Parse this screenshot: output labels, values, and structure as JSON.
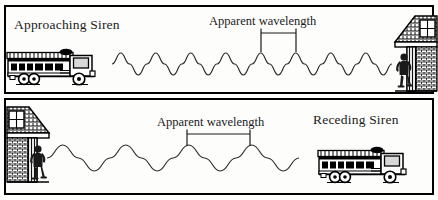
{
  "figure": {
    "title_alt": "Doppler effect: approaching and receding siren",
    "background": "#fdfdfc",
    "ink": "#000000",
    "border_width_px": 2,
    "width": 438,
    "height": 200
  },
  "panels": [
    {
      "id": "top",
      "name": "approaching-siren-panel",
      "label": "Approaching Siren",
      "annotation": "Apparent wavelength",
      "source": "fire-truck",
      "source_side": "left",
      "observer_side": "right",
      "wave": {
        "cycles": 8,
        "wavelength_px": 35,
        "amplitude_px": 11,
        "start_x": 112,
        "end_x": 392,
        "baseline_y": 64,
        "description": "short wavelength, compressed waves"
      },
      "bracket": {
        "x_start": 261,
        "x_end": 296,
        "y": 33,
        "tick_height": 9,
        "measures": "one wavelength (peak to peak)"
      }
    },
    {
      "id": "bottom",
      "name": "receding-siren-panel",
      "label": "Receding Siren",
      "annotation": "Apparent wavelength",
      "source": "fire-truck",
      "source_side": "right",
      "observer_side": "left",
      "wave": {
        "cycles": 4,
        "wavelength_px": 63,
        "amplitude_px": 13,
        "start_x": 47,
        "end_x": 299,
        "baseline_y": 158,
        "description": "long wavelength, stretched waves"
      },
      "bracket": {
        "x_start": 187,
        "x_end": 250,
        "y": 134,
        "tick_height": 9,
        "measures": "one wavelength (peak to peak)"
      }
    }
  ],
  "objects": {
    "fire_truck_top": {
      "name": "fire-truck",
      "x": 6,
      "y": 47,
      "width": 104,
      "height": 40,
      "facing": "right"
    },
    "fire_truck_bottom": {
      "name": "fire-truck",
      "x": 317,
      "y": 145,
      "width": 104,
      "height": 40,
      "facing": "right"
    },
    "house_top": {
      "name": "house",
      "x": 393,
      "y": 12,
      "width": 45,
      "height": 78,
      "facing": "left"
    },
    "house_bottom": {
      "name": "house",
      "x": 6,
      "y": 103,
      "width": 45,
      "height": 88,
      "facing": "right"
    },
    "observer_top": {
      "name": "person-observer",
      "x": 396,
      "y": 53,
      "width": 16,
      "height": 35
    },
    "observer_bottom": {
      "name": "person-observer",
      "x": 30,
      "y": 145,
      "width": 16,
      "height": 40
    }
  }
}
